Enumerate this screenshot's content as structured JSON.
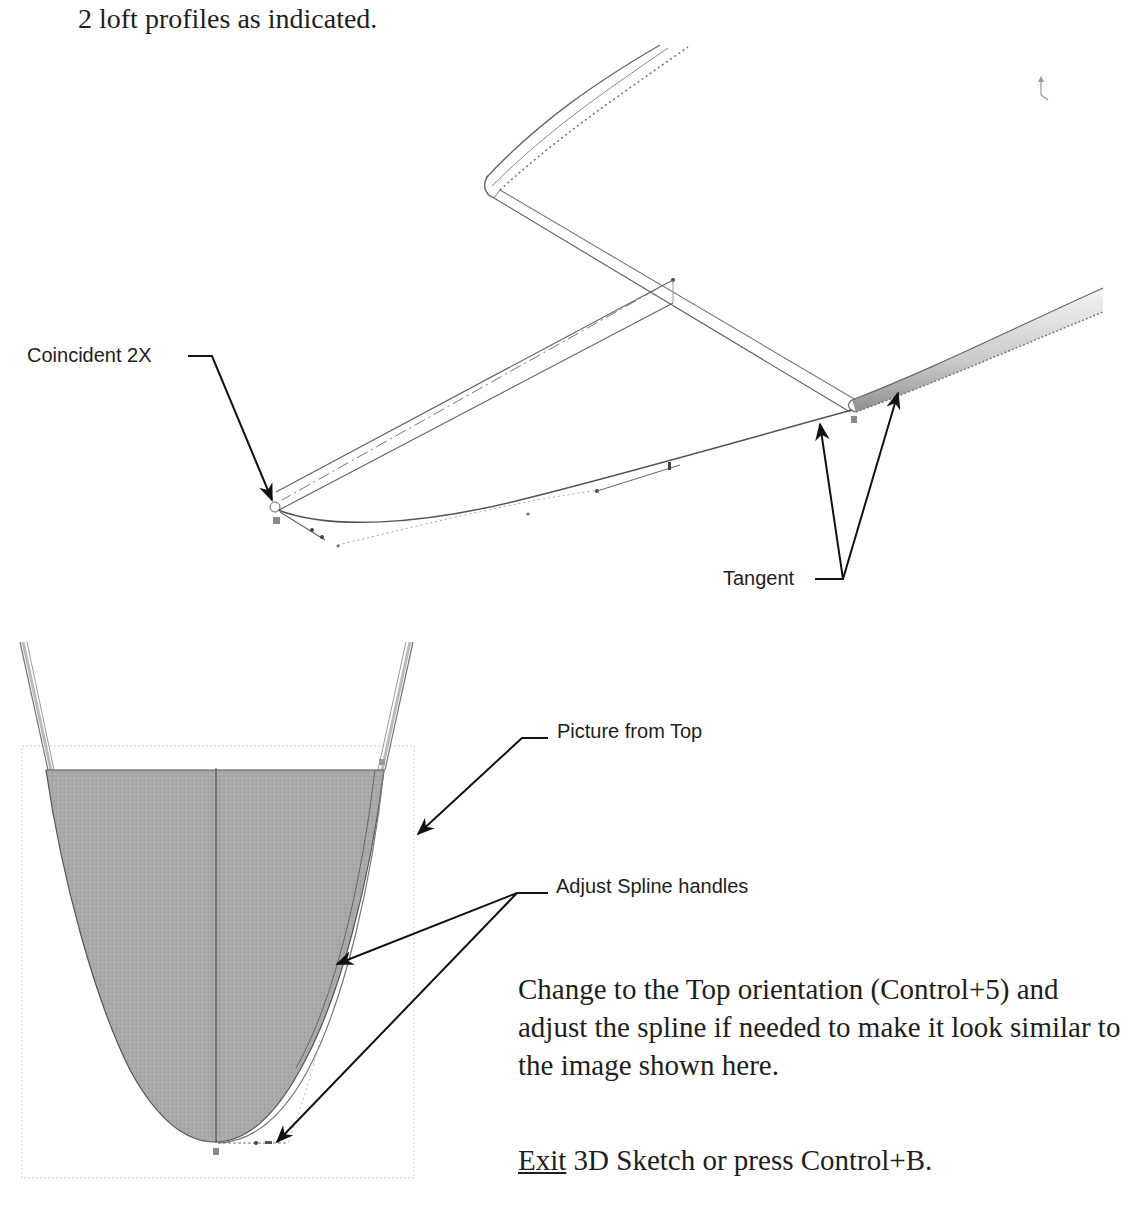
{
  "intro": {
    "text": "2 loft profiles as indicated."
  },
  "top_figure": {
    "callouts": {
      "coincident": "Coincident 2X",
      "tangent": "Tangent"
    },
    "triad_icon": "axis-triad-icon"
  },
  "bottom_figure": {
    "callouts": {
      "picture_from_top": "Picture from Top",
      "adjust_spline": "Adjust Spline handles"
    },
    "fill_color": "#a8a8a8"
  },
  "instructions": {
    "paragraph": "Change to the Top orientation (Control+5) and adjust the spline if needed to make it look similar to the image shown here.",
    "exit_link": "Exit",
    "exit_rest": " 3D Sketch or press Control+B."
  },
  "colors": {
    "line": "#5a5a5a",
    "arrow": "#111111",
    "fill": "#a8a8a8",
    "tube": "#cfcfcf"
  }
}
